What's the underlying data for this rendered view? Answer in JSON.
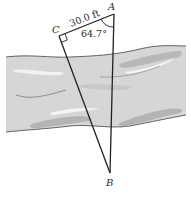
{
  "diagram": {
    "type": "geometry-word-problem",
    "points": {
      "A": {
        "label": "A",
        "x": 114,
        "y": 14
      },
      "B": {
        "label": "B",
        "x": 110,
        "y": 173
      },
      "C": {
        "label": "C",
        "x": 59,
        "y": 36
      }
    },
    "segments": [
      {
        "from": "C",
        "to": "A",
        "label": "30.0 ft"
      },
      {
        "from": "C",
        "to": "B",
        "label": ""
      },
      {
        "from": "A",
        "to": "B",
        "label": ""
      }
    ],
    "angles": [
      {
        "vertex": "A",
        "label": "64.7°"
      },
      {
        "vertex": "C",
        "label": "right-angle"
      }
    ],
    "labels": {
      "point_a": "A",
      "point_b": "B",
      "point_c": "C",
      "side_ca": "30.0 ft",
      "angle_a": "64.7°"
    },
    "colors": {
      "river_fill": "#d6d6d6",
      "river_shadow": "#b4b4b4",
      "river_highlight": "#f4f4f4",
      "bank_line": "#555555",
      "triangle_line": "#222222",
      "background": "#ffffff"
    }
  }
}
